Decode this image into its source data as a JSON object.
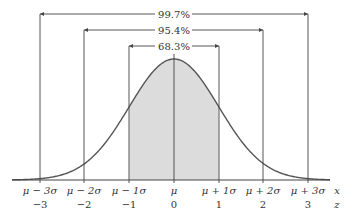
{
  "diagram": {
    "type": "normal-distribution-empirical-rule",
    "brackets": [
      {
        "label": "99.7%",
        "from": -3,
        "to": 3
      },
      {
        "label": "95.4%",
        "from": -2,
        "to": 2
      },
      {
        "label": "68.3%",
        "from": -1,
        "to": 1
      }
    ],
    "x_axis": {
      "name": "x",
      "ticks": [
        "μ − 3σ",
        "μ − 2σ",
        "μ − 1σ",
        "μ",
        "μ + 1σ",
        "μ + 2σ",
        "μ + 3σ"
      ]
    },
    "z_axis": {
      "name": "z",
      "ticks": [
        "−3",
        "−2",
        "−1",
        "0",
        "1",
        "2",
        "3"
      ]
    },
    "shaded_region": {
      "from": -1,
      "to": 1,
      "color": "#dcdcdc"
    },
    "colors": {
      "curve": "#555555",
      "lines": "#444444",
      "shade": "#dcdcdc"
    }
  }
}
